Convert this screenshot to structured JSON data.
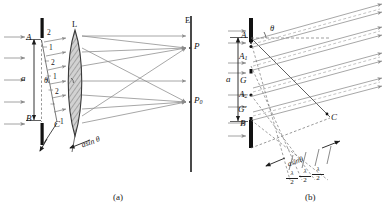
{
  "figure": {
    "captions": {
      "a": "(a)",
      "b": "(b)"
    }
  },
  "panel_a": {
    "slit": {
      "top_point_label": "A",
      "bottom_point_label": "B",
      "corner_label": "C",
      "width_label": "a",
      "angle_label": "θ"
    },
    "lens": {
      "label": "L"
    },
    "screen": {
      "label": "E",
      "focus_label": "P",
      "axial_label": "P",
      "axial_sub": "0"
    },
    "path_difference_label": "asin θ",
    "wavefront_numbers": [
      "2",
      "1",
      "2",
      "1",
      "2",
      "1"
    ],
    "incoming_ray_count": 5,
    "outgoing_ray_count": 5
  },
  "panel_b": {
    "slit": {
      "top_point_label": "A",
      "zone1_label": "A",
      "zone1_sub": "1",
      "mid_label": "G",
      "zone2_label": "A",
      "zone2_sub": "2",
      "mid2_label": "G′",
      "bottom_point_label": "B",
      "corner_label": "C",
      "width_label": "a",
      "angle_label": "θ"
    },
    "path_difference_label": "asinθ",
    "half_wave_segments": [
      {
        "num": "λ",
        "den": "2"
      },
      {
        "num": "λ",
        "den": "2"
      },
      {
        "num": "λ",
        "den": "2"
      }
    ],
    "incoming_ray_count": 6,
    "outgoing_ray_bundles": 4
  },
  "colors": {
    "ray": "#8a8a8a",
    "line": "#4a4a4a",
    "barrier": "#111111",
    "lens_fill": "#cfcfcf",
    "lens_stroke": "#3a3a3a",
    "dashed": "#6e6e6e",
    "text": "#141414",
    "background": "#ffffff"
  }
}
